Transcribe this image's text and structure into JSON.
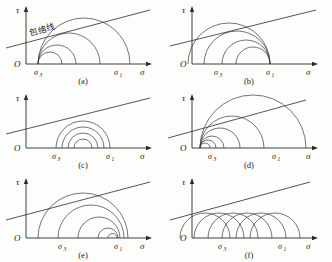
{
  "figure": {
    "panel_count": 6,
    "background_color": "#fdfdfc",
    "line_color": "#2b2b2b",
    "circle_color": "#3a3a3a"
  },
  "axes": {
    "vertical_label": "τ",
    "horizontal_label": "σ",
    "origin_label": "O",
    "sigma3_label": "σ",
    "sigma3_sub": "3",
    "sigma1_label": "σ",
    "sigma1_sub": "1"
  },
  "annotations": {
    "envelope_label": "包络线"
  },
  "panels": [
    {
      "id": "a",
      "caption": "(a)",
      "description": "circles left-anchored at sigma3 with increasing right edge",
      "has_envelope_label": true,
      "sigma3_x": 38,
      "sigma1_x": 118,
      "envelope": {
        "x1": 6,
        "y1": 48,
        "x2": 150,
        "y2": 10
      },
      "circles": [
        {
          "left": 38,
          "right": 62
        },
        {
          "left": 38,
          "right": 76
        },
        {
          "left": 38,
          "right": 100
        },
        {
          "left": 38,
          "right": 130
        }
      ]
    },
    {
      "id": "b",
      "caption": "(b)",
      "description": "circles right-anchored at sigma1 with decreasing left edge",
      "has_envelope_label": false,
      "sigma3_x": 52,
      "sigma1_x": 104,
      "envelope": {
        "x1": 4,
        "y1": 46,
        "x2": 150,
        "y2": 10
      },
      "circles": [
        {
          "left": 70,
          "right": 104
        },
        {
          "left": 56,
          "right": 104
        },
        {
          "left": 38,
          "right": 104
        },
        {
          "left": 22,
          "right": 104
        }
      ]
    },
    {
      "id": "c",
      "caption": "(c)",
      "description": "nested circles with common tangency near top",
      "has_envelope_label": false,
      "sigma3_x": 56,
      "sigma1_x": 110,
      "envelope": {
        "x1": 6,
        "y1": 46,
        "x2": 150,
        "y2": 10
      },
      "circles": [
        {
          "left": 56,
          "right": 110
        },
        {
          "left": 62,
          "right": 104
        },
        {
          "left": 68,
          "right": 98
        },
        {
          "left": 74,
          "right": 92
        }
      ]
    },
    {
      "id": "d",
      "caption": "(d)",
      "description": "small circles clustered at sigma3 growing to large circle",
      "has_envelope_label": false,
      "sigma3_x": 46,
      "sigma1_x": 110,
      "envelope": {
        "x1": 2,
        "y1": 50,
        "x2": 140,
        "y2": 12
      },
      "circles": [
        {
          "left": 34,
          "right": 44
        },
        {
          "left": 34,
          "right": 50
        },
        {
          "left": 34,
          "right": 58
        },
        {
          "left": 34,
          "right": 74
        },
        {
          "left": 34,
          "right": 98
        },
        {
          "left": 34,
          "right": 140
        }
      ]
    },
    {
      "id": "e",
      "caption": "(e)",
      "description": "circles right edges converging near sigma1 with decreasing size",
      "has_envelope_label": false,
      "sigma3_x": 62,
      "sigma1_x": 118,
      "envelope": {
        "x1": 6,
        "y1": 48,
        "x2": 150,
        "y2": 10
      },
      "circles": [
        {
          "left": 38,
          "right": 128
        },
        {
          "left": 58,
          "right": 124
        },
        {
          "left": 78,
          "right": 120
        },
        {
          "left": 98,
          "right": 118
        },
        {
          "left": 108,
          "right": 117
        }
      ]
    },
    {
      "id": "f",
      "caption": "(f)",
      "description": "equal radius circles translated along sigma axis",
      "has_envelope_label": false,
      "sigma3_x": 56,
      "sigma1_x": 116,
      "envelope": {
        "x1": 4,
        "y1": 48,
        "x2": 144,
        "y2": 10
      },
      "circles": [
        {
          "left": 14,
          "right": 64
        },
        {
          "left": 28,
          "right": 78
        },
        {
          "left": 42,
          "right": 92
        },
        {
          "left": 56,
          "right": 106
        },
        {
          "left": 70,
          "right": 120
        },
        {
          "left": 84,
          "right": 134
        }
      ]
    }
  ]
}
